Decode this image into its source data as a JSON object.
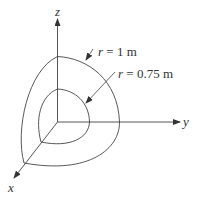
{
  "diagram": {
    "axes": {
      "x": {
        "label": "x"
      },
      "y": {
        "label": "y"
      },
      "z": {
        "label": "z"
      }
    },
    "surfaces": [
      {
        "name": "outer",
        "label_var": "r",
        "label_eq": " = 1 m",
        "radius": 1
      },
      {
        "name": "inner",
        "label_var": "r",
        "label_eq": " = 0.75 m",
        "radius": 0.75
      }
    ],
    "colors": {
      "line": "#444444",
      "text": "#333333",
      "background": "#ffffff"
    }
  }
}
